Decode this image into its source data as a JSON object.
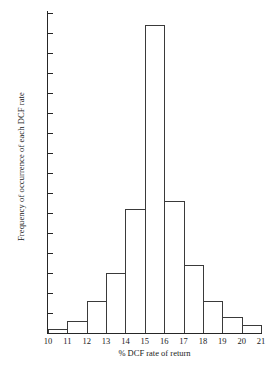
{
  "chart_data": {
    "type": "bar",
    "title": "",
    "xlabel": "% DCF rate of return",
    "ylabel": "Frequency of occurrence of each DCF rate",
    "categories": [
      "10-11",
      "11-12",
      "12-13",
      "13-14",
      "14-15",
      "15-16",
      "16-17",
      "17-18",
      "18-19",
      "19-20",
      "20-21"
    ],
    "bin_edges": [
      10,
      11,
      12,
      13,
      14,
      15,
      16,
      17,
      18,
      19,
      20,
      21
    ],
    "values": [
      1,
      3,
      8,
      15,
      31,
      77,
      33,
      17,
      8,
      4,
      2
    ],
    "xlim": [
      10,
      21
    ],
    "ylim": [
      0,
      80
    ],
    "xticks": [
      "10",
      "11",
      "12",
      "13",
      "14",
      "15",
      "16",
      "17",
      "18",
      "19",
      "20",
      "21"
    ],
    "yticks": [
      "0",
      "5",
      "10",
      "15",
      "20",
      "25",
      "30",
      "35",
      "40",
      "45",
      "50",
      "55",
      "60",
      "65",
      "70",
      "75",
      "80"
    ],
    "ytick_values": [
      0,
      5,
      10,
      15,
      20,
      25,
      30,
      35,
      40,
      45,
      50,
      55,
      60,
      65,
      70,
      75,
      80
    ],
    "grid": false,
    "legend": false,
    "bar_fill": "#ffffff",
    "bar_edge": "#3a3a3a",
    "axis_color": "#262626"
  }
}
